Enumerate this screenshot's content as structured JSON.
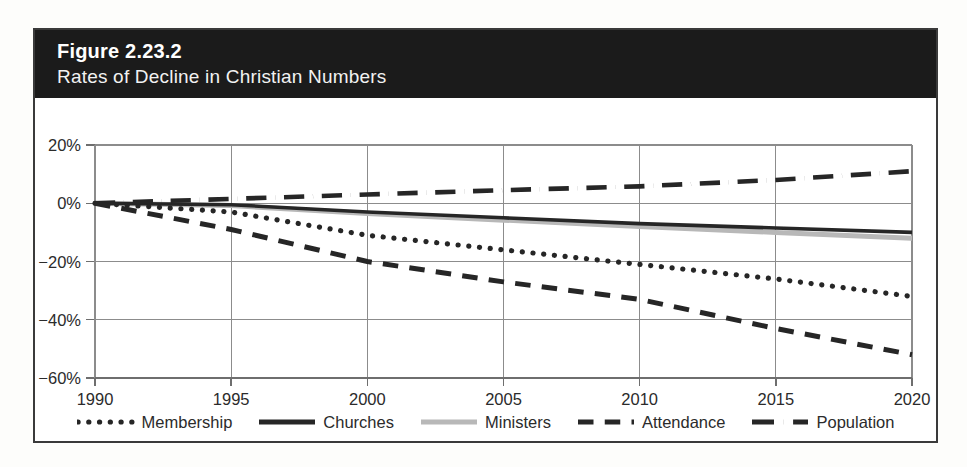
{
  "figure": {
    "number_label": "Figure 2.23.2",
    "subtitle": "Rates of Decline in Christian Numbers",
    "header_bg": "#1b1b1b",
    "header_text_color": "#ffffff",
    "frame_border_color": "#3a3a3a"
  },
  "chart_data": {
    "type": "line",
    "title": "Rates of Decline in Christian Numbers",
    "subtitle": "Figure 2.23.2",
    "xlabel": "",
    "ylabel": "",
    "grid": true,
    "legend_position": "bottom",
    "x": [
      1990,
      1995,
      2000,
      2005,
      2010,
      2015,
      2020
    ],
    "xtick_labels": [
      "1990",
      "1995",
      "2000",
      "2005",
      "2010",
      "2015",
      "2020"
    ],
    "xlim": [
      1990,
      2020
    ],
    "ylim": [
      -60,
      20
    ],
    "yticks": [
      20,
      0,
      -20,
      -40,
      -60
    ],
    "ytick_labels": [
      "20%",
      "0%",
      "−20%",
      "−40%",
      "−60%"
    ],
    "y_unit": "%",
    "series": [
      {
        "name": "Membership",
        "values": [
          0,
          -3,
          -11,
          -16,
          -21,
          -26,
          -32
        ],
        "style": "dotted",
        "color": "#262626",
        "width": 5.2
      },
      {
        "name": "Churches",
        "values": [
          0,
          -0.5,
          -3,
          -5,
          -7,
          -8.5,
          -10
        ],
        "style": "solid",
        "color": "#262626",
        "width": 3.6
      },
      {
        "name": "Ministers",
        "values": [
          0,
          -0.8,
          -3.5,
          -5.8,
          -8,
          -10,
          -12
        ],
        "style": "solid",
        "color": "#b8b8b8",
        "width": 5.0
      },
      {
        "name": "Attendance",
        "values": [
          0,
          -9,
          -20,
          -27,
          -33,
          -43,
          -52
        ],
        "style": "dashed",
        "color": "#262626",
        "width": 5.0
      },
      {
        "name": "Population",
        "values": [
          0,
          1.5,
          3,
          4.5,
          5.8,
          8,
          11
        ],
        "style": "dashdot",
        "color": "#262626",
        "width": 4.6
      }
    ]
  },
  "legend": {
    "items": [
      {
        "label": "Membership",
        "swatch": "dotted-line-swatch"
      },
      {
        "label": "Churches",
        "swatch": "solid-line-swatch"
      },
      {
        "label": "Ministers",
        "swatch": "gray-solid-line-swatch"
      },
      {
        "label": "Attendance",
        "swatch": "dashed-line-swatch"
      },
      {
        "label": "Population",
        "swatch": "dashdot-line-swatch"
      }
    ]
  }
}
